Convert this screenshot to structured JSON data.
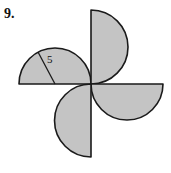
{
  "problem": {
    "number": "9."
  },
  "figure": {
    "fill_color": "#c4c4c4",
    "stroke_color": "#1a1a1a",
    "radius_label": "5",
    "semicircles": [
      {
        "name": "left",
        "diameter_axis": "horizontal",
        "bulge": "up"
      },
      {
        "name": "top",
        "diameter_axis": "vertical",
        "bulge": "right"
      },
      {
        "name": "right",
        "diameter_axis": "horizontal",
        "bulge": "down"
      },
      {
        "name": "bottom",
        "diameter_axis": "vertical",
        "bulge": "left"
      }
    ]
  }
}
